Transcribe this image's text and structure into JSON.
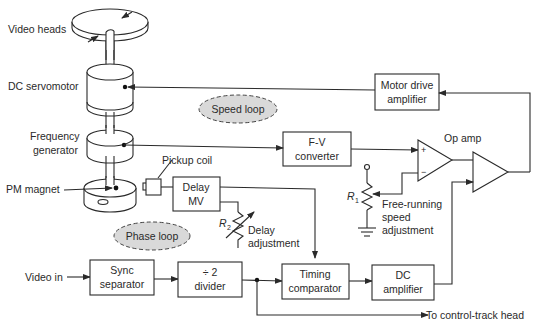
{
  "diagram": {
    "labels": {
      "video_heads": "Video heads",
      "dc_servomotor": "DC servomotor",
      "frequency_generator_1": "Frequency",
      "frequency_generator_2": "generator",
      "pm_magnet": "PM magnet",
      "pickup_coil": "Pickup coil",
      "video_in": "Video in",
      "op_amp": "Op amp",
      "to_control_track": "To control-track head",
      "r1": "R",
      "r1_sub": "1",
      "r2": "R",
      "r2_sub": "2",
      "free_running_1": "Free-running",
      "free_running_2": "speed",
      "free_running_3": "adjustment",
      "delay_adj_1": "Delay",
      "delay_adj_2": "adjustment",
      "plus": "+",
      "minus": "−"
    },
    "loops": {
      "speed": "Speed loop",
      "phase": "Phase loop"
    },
    "blocks": {
      "motor_drive": [
        "Motor drive",
        "amplifier"
      ],
      "fv_converter": [
        "F-V",
        "converter"
      ],
      "delay_mv": [
        "Delay",
        "MV"
      ],
      "sync_separator": [
        "Sync",
        "separator"
      ],
      "divider": [
        "÷ 2",
        "divider"
      ],
      "timing_comparator": [
        "Timing",
        "comparator"
      ],
      "dc_amplifier": [
        "DC",
        "amplifier"
      ]
    },
    "colors": {
      "line": "#2a2a2a",
      "loop_fill": "#d9d9d9"
    }
  }
}
